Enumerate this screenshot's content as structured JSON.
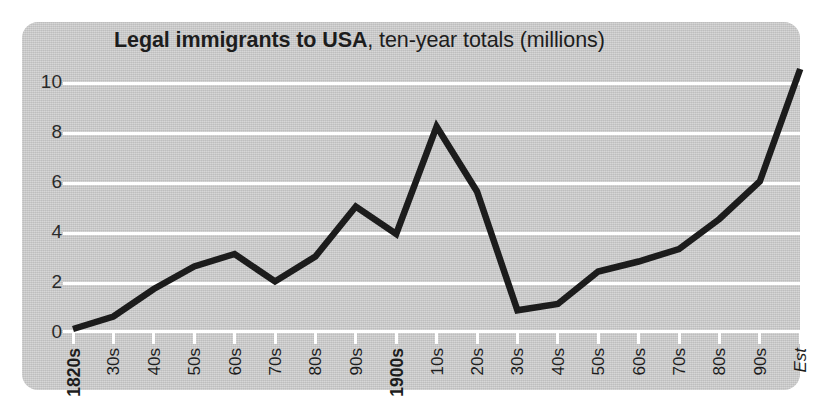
{
  "title": {
    "strong": "Legal immigrants to USA",
    "rest": ", ten-year totals (millions)"
  },
  "colors": {
    "panel_background": "#c9c9c9",
    "page_background": "#ffffff",
    "gridline": "#ffffff",
    "series_line": "#1c1c1c",
    "text": "#1d1d1d"
  },
  "chart_data": {
    "type": "line",
    "title": "Legal immigrants to USA, ten-year totals (millions)",
    "xlabel": "",
    "ylabel": "",
    "ylim": [
      0,
      11
    ],
    "yticks": [
      0,
      2,
      4,
      6,
      8,
      10
    ],
    "ytick_labels": [
      "0",
      "2",
      "4",
      "6",
      "8",
      "10"
    ],
    "grid": true,
    "legend": "none",
    "units": "millions",
    "categories": [
      "1820s",
      "30s",
      "40s",
      "50s",
      "60s",
      "70s",
      "80s",
      "90s",
      "1900s",
      "10s",
      "20s",
      "30s",
      "40s",
      "50s",
      "60s",
      "70s",
      "80s",
      "90s",
      "Est"
    ],
    "category_styles": [
      "emph",
      "normal",
      "normal",
      "normal",
      "normal",
      "normal",
      "normal",
      "normal",
      "emph",
      "normal",
      "normal",
      "normal",
      "normal",
      "normal",
      "normal",
      "normal",
      "normal",
      "normal",
      "italic"
    ],
    "series": [
      {
        "name": "Legal immigrants to USA",
        "values": [
          0.1,
          0.6,
          1.7,
          2.6,
          3.1,
          2.0,
          3.0,
          5.0,
          3.9,
          8.2,
          5.6,
          0.85,
          1.1,
          2.4,
          2.8,
          3.3,
          4.5,
          6.0,
          10.5
        ]
      }
    ]
  }
}
